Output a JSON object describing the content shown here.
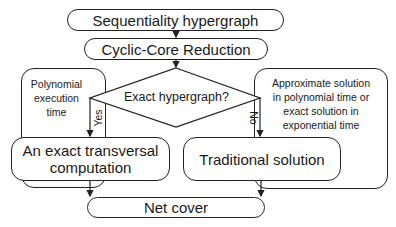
{
  "diagram": {
    "type": "flowchart",
    "nodes": {
      "start": "Sequentiality hypergraph",
      "reduction": "Cyclic-Core Reduction",
      "decision": "Exact hypergraph?",
      "left_note": "Polynomial execution time",
      "left_note_lines": [
        "Polynomial",
        "execution",
        "time"
      ],
      "right_note_lines": [
        "Approximate solution",
        "in polynomial time or",
        "exact solution in",
        "exponential time"
      ],
      "exact": [
        "An exact transversal",
        "computation"
      ],
      "traditional": "Traditional solution",
      "end": "Net cover"
    },
    "edges": {
      "yes_label": "Yes",
      "no_label": "No"
    }
  }
}
